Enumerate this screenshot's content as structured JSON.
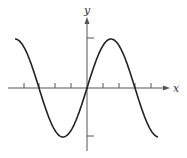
{
  "chart_data": {
    "type": "line",
    "title": "",
    "xlabel": "x",
    "ylabel": "y",
    "function": "y = sin(x)",
    "x_range": [
      -4.71,
      4.65
    ],
    "ylim": [
      -1,
      1
    ],
    "x_ticks": [
      -5.24,
      -4.19,
      -3.14,
      -2.09,
      -1.05,
      1.05,
      2.09,
      3.14,
      4.19
    ],
    "y_ticks": [
      -1,
      1
    ],
    "x_tick_labels": [],
    "y_tick_labels": [],
    "grid": false,
    "legend": null,
    "series": [
      {
        "name": "sine curve",
        "x": [
          -4.71,
          -3.14,
          -1.57,
          0,
          1.57,
          3.14,
          4.65
        ],
        "values": [
          1,
          0,
          -1,
          0,
          1,
          0,
          -1
        ]
      }
    ],
    "colors": {
      "curve": "#222222",
      "axes": "#555555"
    }
  },
  "labels": {
    "x_axis": "x",
    "y_axis": "y"
  }
}
